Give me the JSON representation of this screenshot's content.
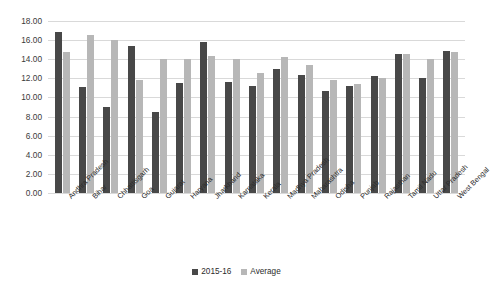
{
  "chart_data": {
    "type": "bar",
    "title": "",
    "subtitle": "",
    "xlabel": "",
    "ylabel": "",
    "ylim": [
      0,
      18
    ],
    "ytick_step": 2,
    "ytick_labels": [
      "18.00",
      "16.00",
      "14.00",
      "12.00",
      "10.00",
      "8.00",
      "6.00",
      "4.00",
      "2.00",
      "0.00"
    ],
    "ytick_values": [
      18,
      16,
      14,
      12,
      10,
      8,
      6,
      4,
      2,
      0
    ],
    "grid": true,
    "legend_position": "bottom",
    "categories": [
      "Andhra Pradesh",
      "Bihar",
      "Chhattisgarh",
      "Goa",
      "Gujarat",
      "Haryana",
      "Jharkhand",
      "Karnataka",
      "Kerala",
      "Madhya Pradesh",
      "Maharashtra",
      "Odisha",
      "Punjab",
      "Rajasthan",
      "Tamil Nadu",
      "Uttar Pradesh",
      "West Bengal"
    ],
    "series": [
      {
        "name": "2015-16",
        "color": "#484848",
        "values": [
          16.9,
          11.1,
          9.0,
          15.4,
          8.5,
          11.5,
          15.8,
          11.6,
          11.2,
          13.0,
          12.3,
          10.7,
          11.2,
          12.2,
          14.6,
          12.0,
          14.9
        ]
      },
      {
        "name": "Average",
        "color": "#b7b7b7",
        "values": [
          14.8,
          16.5,
          16.0,
          11.8,
          14.0,
          14.0,
          14.3,
          14.0,
          12.6,
          14.2,
          13.4,
          11.8,
          11.4,
          12.0,
          14.5,
          14.0,
          14.8
        ]
      }
    ]
  },
  "colors": {
    "series_2015_16": "#484848",
    "series_average": "#b7b7b7",
    "gridline": "#d9d9d9",
    "background": "#ffffff",
    "text": "#2b2b2b"
  }
}
